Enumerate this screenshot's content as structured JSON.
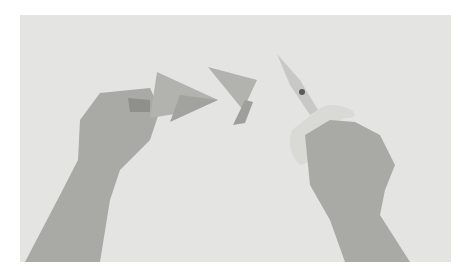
{
  "image": {
    "description": "Grayscale photo of two hands: left hand holding folded paper triangles, right hand holding scissors, with a cut paper piece between them",
    "colors": {
      "background": "#e4e4e2",
      "skin": "#a9a9a6",
      "paper": "#b2b2ae",
      "scissor_handle": "#d9d9d6",
      "blade": "#c8c8c6"
    }
  }
}
